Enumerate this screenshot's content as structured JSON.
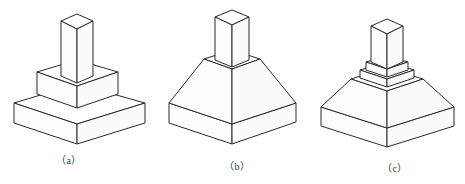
{
  "plate": {
    "name": "isometric-pedestal-figures",
    "background_color": "#fefefe",
    "line_color": "#2b2b2b",
    "figure_count": 3
  },
  "figures": [
    {
      "id": "a",
      "caption": "（a）",
      "description": "Stepped square pedestal: two rectangular slab tiers with a tall square prism column on top",
      "parts": [
        "lower-square-slab",
        "upper-square-slab",
        "square-prism-column"
      ]
    },
    {
      "id": "b",
      "caption": "（b）",
      "description": "Truncated pyramid frustum on a flat square slab with a tall square prism column on top",
      "parts": [
        "bottom-square-slab",
        "pyramid-frustum",
        "square-prism-column"
      ]
    },
    {
      "id": "c",
      "caption": "（c）",
      "description": "Tapered frustum base with a small stepped collar and a tall square prism column on top",
      "parts": [
        "bottom-square-slab",
        "tapered-frustum",
        "stepped-collar",
        "square-prism-column"
      ]
    }
  ],
  "captions": {
    "a": "（a）",
    "b": "（b）",
    "c": "（c）"
  }
}
